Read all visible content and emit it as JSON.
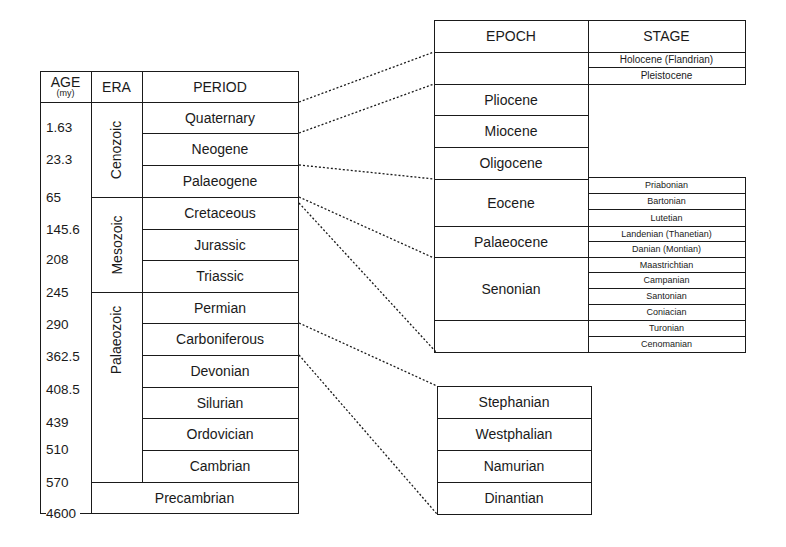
{
  "left_table": {
    "headers": {
      "age": "AGE",
      "age_unit": "(my)",
      "era": "ERA",
      "period": "PERIOD"
    },
    "ages": [
      "1.63",
      "23.3",
      "65",
      "145.6",
      "208",
      "245",
      "290",
      "362.5",
      "408.5",
      "439",
      "510",
      "570",
      "4600"
    ],
    "eras": [
      {
        "name": "Cenozoic",
        "rows": 3
      },
      {
        "name": "Mesozoic",
        "rows": 3
      },
      {
        "name": "Palaeozoic",
        "rows": 6
      }
    ],
    "periods": [
      "Quaternary",
      "Neogene",
      "Palaeogene",
      "Cretaceous",
      "Jurassic",
      "Triassic",
      "Permian",
      "Carboniferous",
      "Devonian",
      "Silurian",
      "Ordovician",
      "Cambrian"
    ],
    "precambrian": "Precambrian"
  },
  "cenozoic_table": {
    "headers": {
      "epoch": "EPOCH",
      "stage": "STAGE"
    },
    "quaternary_stages": [
      "Holocene (Flandrian)",
      "Pleistocene"
    ],
    "epochs": [
      "Pliocene",
      "Miocene",
      "Oligocene"
    ]
  },
  "lower_table": {
    "epochs": [
      {
        "name": "Eocene",
        "stages": [
          "Priabonian",
          "Bartonian",
          "Lutetian"
        ]
      },
      {
        "name": "Palaeocene",
        "stages": [
          "Landenian (Thanetian)",
          "Danian (Montian)"
        ]
      },
      {
        "name": "Senonian",
        "stages": [
          "Maastrichtian",
          "Campanian",
          "Santonian",
          "Coniacian"
        ]
      },
      {
        "name": "",
        "stages": [
          "Turonian",
          "Cenomanian"
        ]
      }
    ]
  },
  "carboniferous_table": {
    "stages": [
      "Stephanian",
      "Westphalian",
      "Namurian",
      "Dinantian"
    ]
  },
  "colors": {
    "ink": "#1a1a1a",
    "background": "#ffffff"
  }
}
